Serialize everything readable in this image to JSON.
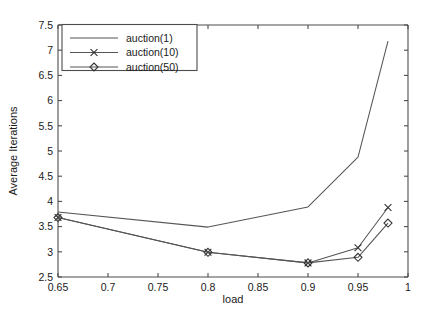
{
  "chart_data": {
    "type": "line",
    "title": "",
    "xlabel": "load",
    "ylabel": "Average Iterations",
    "xlim": [
      0.65,
      1.0
    ],
    "ylim": [
      2.5,
      7.5
    ],
    "grid": false,
    "legend_position": "top-left",
    "x": [
      0.65,
      0.8,
      0.9,
      0.95,
      0.98
    ],
    "xticks": [
      "0.65",
      "0.7",
      "0.75",
      "0.8",
      "0.85",
      "0.9",
      "0.95",
      "1"
    ],
    "xtick_values": [
      0.65,
      0.7,
      0.75,
      0.8,
      0.85,
      0.9,
      0.95,
      1.0
    ],
    "yticks": [
      "2.5",
      "3",
      "3.5",
      "4",
      "4.5",
      "5",
      "5.5",
      "6",
      "6.5",
      "7",
      "7.5"
    ],
    "ytick_values": [
      2.5,
      3,
      3.5,
      4,
      4.5,
      5,
      5.5,
      6,
      6.5,
      7,
      7.5
    ],
    "series": [
      {
        "name": "auction(1)",
        "marker": "none",
        "color": "#555555",
        "values": [
          3.79,
          3.49,
          3.89,
          4.88,
          7.18
        ]
      },
      {
        "name": "auction(10)",
        "marker": "x",
        "color": "#555555",
        "values": [
          3.68,
          2.99,
          2.78,
          3.08,
          3.88
        ]
      },
      {
        "name": "auction(50)",
        "marker": "diamond",
        "color": "#555555",
        "values": [
          3.68,
          2.99,
          2.78,
          2.89,
          3.57
        ]
      }
    ]
  },
  "legend": {
    "entries": [
      {
        "label": "auction(1)"
      },
      {
        "label": "auction(10)"
      },
      {
        "label": "auction(50)"
      }
    ]
  }
}
